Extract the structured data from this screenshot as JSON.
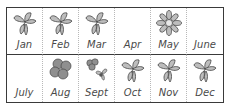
{
  "calendar": {
    "rows": [
      [
        {
          "month": "Jan",
          "icon": "leaves"
        },
        {
          "month": "Feb",
          "icon": "leaves"
        },
        {
          "month": "Mar",
          "icon": "leaves"
        },
        {
          "month": "Apr",
          "icon": "none"
        },
        {
          "month": "May",
          "icon": "flower"
        },
        {
          "month": "June",
          "icon": "none"
        }
      ],
      [
        {
          "month": "July",
          "icon": "none"
        },
        {
          "month": "Aug",
          "icon": "berries"
        },
        {
          "month": "Sept",
          "icon": "berries-and-leaves"
        },
        {
          "month": "Oct",
          "icon": "leaves"
        },
        {
          "month": "Nov",
          "icon": "leaves"
        },
        {
          "month": "Dec",
          "icon": "leaves"
        }
      ]
    ]
  },
  "colors": {
    "border": "#3a3a3a",
    "divider": "#b8b8b8",
    "icon_fill": "#bdbdbd",
    "icon_stroke": "#444444",
    "text": "#4a4a4a"
  }
}
